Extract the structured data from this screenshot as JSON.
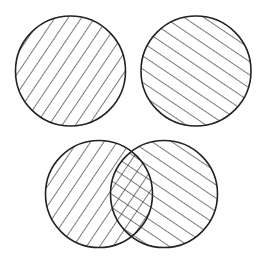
{
  "diagram": {
    "type": "venn-set-illustration",
    "background": "#ffffff",
    "stroke_color": "#222222",
    "hatch_color": "#333333",
    "panels": [
      {
        "name": "set-a",
        "hatch": "backslash",
        "circles": [
          {
            "cx": 70.5,
            "cy": 71,
            "r": 55
          }
        ]
      },
      {
        "name": "set-b",
        "hatch": "slash",
        "circles": [
          {
            "cx": 196,
            "cy": 71,
            "r": 55
          }
        ]
      },
      {
        "name": "union-intersection",
        "hatch": "combined",
        "circles": [
          {
            "cx": 99,
            "cy": 194,
            "r": 53.5,
            "hatch": "backslash"
          },
          {
            "cx": 164,
            "cy": 194,
            "r": 53.5,
            "hatch": "slash"
          }
        ],
        "overlap_hatch": "crosshatch"
      }
    ]
  }
}
